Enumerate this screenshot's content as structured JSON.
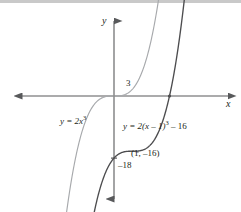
{
  "figure": {
    "title": "",
    "axis_labels": {
      "x": "x",
      "y": "y"
    }
  },
  "labels": {
    "x_axis": "x",
    "y_axis": "y",
    "x_intercept_tick": "3",
    "y_intercept_tick": "–18",
    "point_annotation": "(1, –16)",
    "curve1_equation_prefix": "y = 2x",
    "curve1_equation_exp": "3",
    "curve2_equation_prefix": "y = 2(x – 1)",
    "curve2_equation_exp": "3",
    "curve2_equation_suffix": " – 16"
  },
  "colors": {
    "axis": "#58595b",
    "curve_light": "#a7a9ac",
    "curve_dark": "#4d4d4f",
    "text": "#231f20",
    "top_band": "#c9c9c9"
  },
  "chart_data": {
    "type": "line",
    "title": "",
    "xlabel": "x",
    "ylabel": "y",
    "grid": false,
    "legend": "inline-annotations",
    "xlim": [
      -5.5,
      6.2
    ],
    "ylim": [
      -30,
      22
    ],
    "x_origin_px": 114,
    "y_origin_px": 96,
    "px_per_x_unit": 18.5,
    "px_per_y_unit": 3.45,
    "series": [
      {
        "name": "y = 2x^3",
        "expression": "y = 2x^3",
        "color": "#a7a9ac",
        "label_text": "y = 2x³",
        "label_pos_px": [
          60,
          118
        ],
        "key_points": [
          {
            "x": 0,
            "y": 0,
            "note": "inflection / origin"
          }
        ]
      },
      {
        "name": "y = 2(x-1)^3 - 16",
        "expression": "y = 2(x - 1)^3 - 16",
        "color": "#4d4d4f",
        "label_text": "y = 2(x – 1)³ – 16",
        "label_pos_px": [
          123,
          122
        ],
        "key_points": [
          {
            "x": 3,
            "y": 0,
            "note": "x-intercept, labeled 3"
          },
          {
            "x": 1,
            "y": -16,
            "note": "inflection point, labeled (1, -16)"
          },
          {
            "x": 0,
            "y": -18,
            "note": "y-intercept, labeled -18"
          }
        ]
      }
    ],
    "annotations": [
      {
        "text": "3",
        "x": 3,
        "y": 0,
        "px": [
          121,
          79
        ]
      },
      {
        "text": "(1, –16)",
        "x": 1,
        "y": -16,
        "px": [
          125,
          153
        ]
      },
      {
        "text": "–18",
        "x": 0,
        "y": -18,
        "px": [
          117,
          167
        ]
      }
    ]
  }
}
